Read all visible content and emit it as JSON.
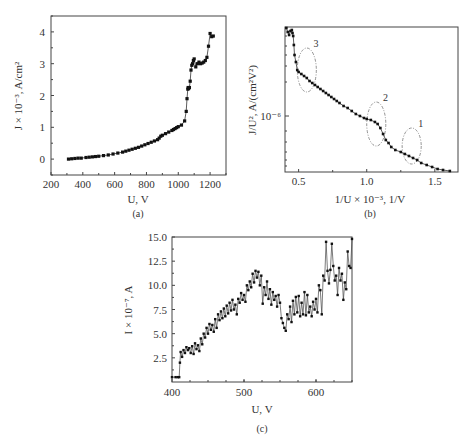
{
  "chart_data": [
    {
      "id": "a",
      "type": "line",
      "caption": "(a)",
      "title": "",
      "xlabel": "U, V",
      "ylabel": "J × 10⁻³, A/cm²",
      "xlim": [
        200,
        1300
      ],
      "ylim": [
        -0.5,
        4.5
      ],
      "xticks": [
        200,
        400,
        600,
        800,
        1000,
        1200
      ],
      "yticks": [
        0,
        1,
        2,
        3,
        4
      ],
      "grid": false,
      "markers": "square",
      "series": [
        {
          "name": "J(U)",
          "x": [
            310,
            330,
            350,
            370,
            390,
            420,
            440,
            460,
            480,
            500,
            530,
            560,
            590,
            620,
            650,
            670,
            690,
            710,
            730,
            750,
            770,
            790,
            810,
            830,
            850,
            870,
            880,
            890,
            900,
            920,
            940,
            960,
            970,
            980,
            990,
            1000,
            1020,
            1040,
            1050,
            1055,
            1060,
            1062,
            1065,
            1070,
            1075,
            1080,
            1085,
            1090,
            1095,
            1100,
            1110,
            1120,
            1130,
            1140,
            1150,
            1160,
            1170,
            1180,
            1190,
            1200,
            1210,
            1220
          ],
          "y": [
            0.0,
            0.01,
            0.02,
            0.03,
            0.03,
            0.05,
            0.06,
            0.07,
            0.08,
            0.09,
            0.11,
            0.13,
            0.16,
            0.19,
            0.22,
            0.25,
            0.28,
            0.31,
            0.34,
            0.37,
            0.41,
            0.45,
            0.49,
            0.53,
            0.57,
            0.61,
            0.66,
            0.72,
            0.75,
            0.8,
            0.85,
            0.9,
            0.93,
            0.96,
            0.99,
            1.02,
            1.07,
            1.2,
            1.5,
            1.9,
            2.2,
            2.25,
            2.22,
            2.25,
            2.45,
            2.8,
            2.95,
            3.0,
            3.1,
            3.15,
            2.9,
            3.0,
            3.05,
            3.0,
            3.02,
            3.05,
            3.1,
            3.2,
            3.55,
            3.95,
            3.85,
            3.87
          ]
        }
      ]
    },
    {
      "id": "b",
      "type": "line",
      "caption": "(b)",
      "title": "",
      "xlabel": "1/U × 10⁻³, 1/V",
      "ylabel": "J/U², A/(cm²V²)",
      "yscale": "log",
      "xlim": [
        0.4,
        1.67
      ],
      "xticks": [
        0.5,
        1.0,
        1.5
      ],
      "ytick_labels": [
        "10⁻⁶"
      ],
      "grid": false,
      "markers": "square",
      "annotations": [
        {
          "label": "3",
          "cx": 0.56,
          "cy_px": 70,
          "rx": 0.07,
          "ry_px": 22
        },
        {
          "label": "2",
          "cx": 1.07,
          "cy_px": 124,
          "rx": 0.07,
          "ry_px": 22
        },
        {
          "label": "1",
          "cx": 1.33,
          "cy_px": 146,
          "rx": 0.07,
          "ry_px": 18
        }
      ],
      "series": [
        {
          "name": "FN plot",
          "x": [
            0.41,
            0.42,
            0.43,
            0.44,
            0.45,
            0.455,
            0.46,
            0.465,
            0.47,
            0.48,
            0.49,
            0.5,
            0.52,
            0.54,
            0.56,
            0.58,
            0.6,
            0.62,
            0.64,
            0.66,
            0.68,
            0.7,
            0.72,
            0.74,
            0.76,
            0.78,
            0.8,
            0.83,
            0.86,
            0.89,
            0.92,
            0.95,
            0.98,
            1.0,
            1.03,
            1.06,
            1.08,
            1.1,
            1.12,
            1.14,
            1.16,
            1.18,
            1.21,
            1.25,
            1.28,
            1.31,
            1.34,
            1.37,
            1.4,
            1.44,
            1.48,
            1.52,
            1.56,
            1.61
          ],
          "y_px": [
            28,
            32,
            35,
            31,
            30,
            33,
            36,
            45,
            55,
            62,
            70,
            72,
            74,
            76,
            78,
            81,
            83,
            85,
            87,
            89,
            91,
            93,
            95,
            97,
            99,
            101,
            103,
            106,
            108,
            111,
            114,
            116,
            118,
            119,
            120,
            122,
            124,
            128,
            134,
            140,
            143,
            147,
            150,
            152,
            154,
            156,
            158,
            160,
            163,
            165,
            167,
            169,
            170,
            171
          ]
        }
      ]
    },
    {
      "id": "c",
      "type": "line",
      "caption": "(c)",
      "title": "",
      "xlabel": "U, V",
      "ylabel": "I × 10⁻⁷, A",
      "xlim": [
        400,
        650
      ],
      "ylim": [
        0,
        15
      ],
      "xticks": [
        400,
        500,
        600
      ],
      "yticks": [
        2.5,
        5.0,
        7.5,
        10.0,
        12.5,
        15.0
      ],
      "grid": false,
      "markers": "square",
      "series": [
        {
          "name": "I(U)",
          "x": [
            400,
            405,
            408,
            410,
            411,
            412,
            414,
            416,
            418,
            420,
            422,
            424,
            426,
            428,
            430,
            432,
            434,
            436,
            438,
            440,
            442,
            444,
            446,
            448,
            450,
            452,
            454,
            456,
            458,
            460,
            462,
            464,
            466,
            468,
            470,
            472,
            474,
            476,
            478,
            480,
            482,
            484,
            486,
            488,
            490,
            492,
            494,
            496,
            498,
            500,
            502,
            504,
            506,
            508,
            510,
            512,
            514,
            516,
            518,
            520,
            522,
            524,
            526,
            528,
            530,
            532,
            534,
            536,
            538,
            540,
            542,
            544,
            546,
            548,
            550,
            552,
            554,
            556,
            558,
            560,
            562,
            564,
            566,
            568,
            570,
            572,
            574,
            576,
            578,
            580,
            582,
            584,
            586,
            588,
            590,
            592,
            594,
            596,
            598,
            600,
            602,
            604,
            606,
            608,
            610,
            612,
            614,
            616,
            618,
            620,
            622,
            624,
            626,
            628,
            630,
            632,
            634,
            636,
            638,
            640,
            642,
            644,
            646,
            648,
            650
          ],
          "y": [
            0.5,
            0.5,
            0.5,
            0.5,
            2.0,
            3.1,
            2.6,
            3.3,
            3.0,
            3.6,
            3.3,
            3.5,
            3.0,
            3.7,
            2.9,
            4.0,
            3.4,
            3.8,
            3.2,
            4.5,
            3.9,
            5.0,
            4.6,
            5.6,
            5.0,
            6.0,
            5.4,
            5.9,
            5.2,
            6.5,
            5.6,
            7.0,
            6.4,
            7.3,
            6.6,
            7.6,
            6.8,
            7.9,
            7.1,
            8.2,
            7.4,
            8.5,
            7.5,
            8.0,
            7.0,
            8.6,
            8.2,
            9.2,
            8.5,
            9.0,
            8.3,
            10.0,
            9.5,
            10.4,
            9.8,
            11.2,
            10.3,
            11.5,
            10.8,
            11.4,
            10.0,
            11.0,
            8.1,
            9.8,
            9.0,
            10.4,
            8.6,
            9.6,
            8.0,
            9.3,
            8.5,
            8.9,
            7.8,
            9.0,
            8.2,
            6.6,
            6.1,
            5.6,
            5.3,
            7.0,
            6.5,
            7.8,
            6.2,
            8.4,
            7.0,
            8.8,
            7.2,
            8.9,
            6.8,
            8.2,
            7.0,
            9.3,
            6.9,
            9.0,
            7.2,
            7.8,
            6.8,
            8.3,
            7.5,
            8.6,
            7.2,
            10.0,
            9.5,
            7.0,
            11.0,
            10.5,
            14.5,
            11.5,
            10.2,
            11.6,
            14.3,
            12.0,
            10.5,
            11.0,
            9.0,
            11.8,
            10.5,
            11.2,
            8.5,
            10.3,
            9.6,
            13.5,
            12.0,
            11.8,
            14.8
          ]
        }
      ]
    }
  ]
}
